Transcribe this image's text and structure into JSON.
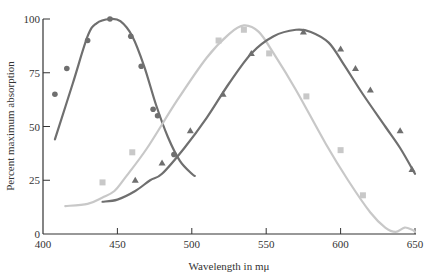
{
  "chart_data": {
    "type": "line",
    "title": "",
    "xlabel": "Wavelength in mμ",
    "ylabel": "Percent maximum absorption",
    "xlim": [
      400,
      650
    ],
    "ylim": [
      0,
      100
    ],
    "xticks": [
      400,
      450,
      500,
      550,
      600,
      650
    ],
    "yticks": [
      0,
      25,
      50,
      75,
      100
    ],
    "grid": false,
    "legend": null,
    "series": [
      {
        "name": "blue-cone",
        "color": "#6f6f6f",
        "marker": "circle",
        "points": [
          [
            408,
            65
          ],
          [
            416,
            77
          ],
          [
            430,
            90
          ],
          [
            445,
            100
          ],
          [
            459,
            92
          ],
          [
            466,
            78
          ],
          [
            474,
            58
          ],
          [
            477,
            55
          ],
          [
            488,
            37
          ]
        ],
        "curve": [
          [
            408,
            44
          ],
          [
            420,
            70
          ],
          [
            430,
            92
          ],
          [
            436,
            98
          ],
          [
            445,
            100
          ],
          [
            452,
            99
          ],
          [
            460,
            92
          ],
          [
            468,
            78
          ],
          [
            476,
            60
          ],
          [
            484,
            45
          ],
          [
            492,
            34
          ],
          [
            500,
            28
          ],
          [
            502,
            27
          ]
        ]
      },
      {
        "name": "green-cone",
        "color": "#c8c8c8",
        "marker": "square",
        "points": [
          [
            440,
            24
          ],
          [
            460,
            38
          ],
          [
            518,
            90
          ],
          [
            535,
            95
          ],
          [
            552,
            84
          ],
          [
            577,
            64
          ],
          [
            600,
            39
          ],
          [
            615,
            18
          ]
        ],
        "curve": [
          [
            415,
            13
          ],
          [
            430,
            14
          ],
          [
            440,
            17
          ],
          [
            448,
            20
          ],
          [
            455,
            26
          ],
          [
            470,
            40
          ],
          [
            490,
            62
          ],
          [
            510,
            82
          ],
          [
            525,
            93
          ],
          [
            535,
            97
          ],
          [
            545,
            94
          ],
          [
            555,
            84
          ],
          [
            570,
            67
          ],
          [
            590,
            42
          ],
          [
            605,
            25
          ],
          [
            620,
            10
          ],
          [
            630,
            3
          ],
          [
            637,
            1
          ],
          [
            643,
            3
          ],
          [
            648,
            2
          ],
          [
            650,
            1
          ]
        ]
      },
      {
        "name": "red-cone",
        "color": "#6f6f6f",
        "marker": "triangle",
        "points": [
          [
            462,
            25
          ],
          [
            480,
            33
          ],
          [
            499,
            48
          ],
          [
            521,
            65
          ],
          [
            540,
            84
          ],
          [
            575,
            94
          ],
          [
            600,
            86
          ],
          [
            610,
            77
          ],
          [
            620,
            67
          ],
          [
            640,
            48
          ],
          [
            648,
            30
          ]
        ],
        "curve": [
          [
            440,
            15
          ],
          [
            450,
            16
          ],
          [
            462,
            20
          ],
          [
            472,
            25
          ],
          [
            480,
            28
          ],
          [
            495,
            40
          ],
          [
            510,
            54
          ],
          [
            525,
            70
          ],
          [
            540,
            84
          ],
          [
            555,
            92
          ],
          [
            570,
            95
          ],
          [
            580,
            94
          ],
          [
            592,
            89
          ],
          [
            602,
            79
          ],
          [
            615,
            65
          ],
          [
            630,
            50
          ],
          [
            640,
            40
          ],
          [
            650,
            28
          ]
        ]
      }
    ]
  },
  "axes": {
    "x_label": "Wavelength in mμ",
    "y_label": "Percent maximum absorption",
    "x_tick_labels": [
      "400",
      "450",
      "500",
      "550",
      "600",
      "650"
    ],
    "y_tick_labels": [
      "0",
      "25",
      "50",
      "75",
      "100"
    ]
  }
}
